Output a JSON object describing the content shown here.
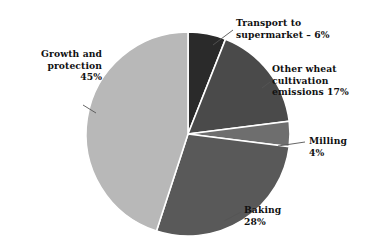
{
  "chart_data": {
    "type": "pie",
    "title": "",
    "subtitle": "",
    "xlabel": "",
    "ylabel": "",
    "legend_position": "none",
    "grid": false,
    "labels_outside": true,
    "categories": [
      "Transport to supermarket",
      "Other wheat cultivation emissions",
      "Milling",
      "Baking",
      "Growth and protection"
    ],
    "values": [
      6,
      17,
      4,
      28,
      45
    ],
    "units": "%",
    "start_angle_deg": 0,
    "direction": "clockwise",
    "slices": [
      {
        "name": "Transport to supermarket",
        "value": 6,
        "label_text": "Transport to\nsupermarket – 6%",
        "color": "#2a2a2a"
      },
      {
        "name": "Other wheat cultivation emissions",
        "value": 17,
        "label_text": "Other wheat\ncultivation\nemissions 17%",
        "color": "#4a4a4a"
      },
      {
        "name": "Milling",
        "value": 4,
        "label_text": "Milling\n4%",
        "color": "#6e6e6e"
      },
      {
        "name": "Baking",
        "value": 28,
        "label_text": "Baking\n28%",
        "color": "#595959"
      },
      {
        "name": "Growth and protection",
        "value": 45,
        "label_text": "Growth and\nprotection\n45%",
        "color": "#b8b8b8"
      }
    ],
    "colors": {
      "background": "#ffffff",
      "slice_border": "#ffffff",
      "leader_line": "#555555",
      "text": "#111111"
    }
  }
}
